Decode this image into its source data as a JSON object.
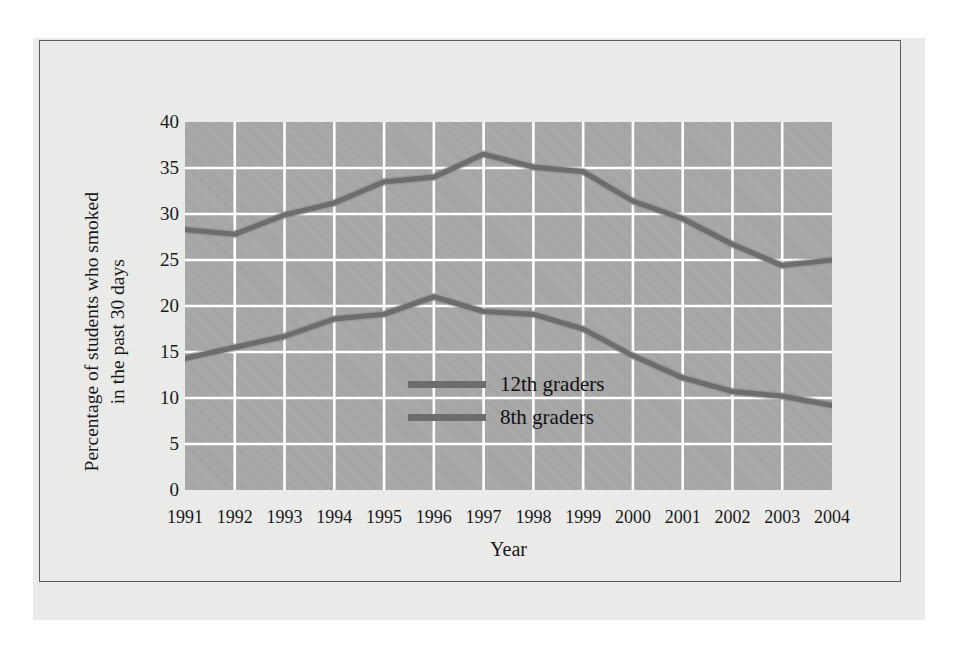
{
  "figure": {
    "paper_color": "#ededec",
    "plot_background_color": "#a8a8a8",
    "grid_color": "#ffffff",
    "frame_color": "#5d5d5d",
    "text_color": "#19191b"
  },
  "chart_data": {
    "type": "line",
    "title": "",
    "xlabel": "Year",
    "ylabel": "Percentage of students who smoked in the past 30 days",
    "ylabel_lines": [
      "Percentage of students who smoked",
      "in the past 30 days"
    ],
    "categories": [
      1991,
      1992,
      1993,
      1994,
      1995,
      1996,
      1997,
      1998,
      1999,
      2000,
      2001,
      2002,
      2003,
      2004
    ],
    "x_tick_labels": [
      "1991",
      "1992",
      "1993",
      "1994",
      "1995",
      "1996",
      "1997",
      "1998",
      "1999",
      "2000",
      "2001",
      "2002",
      "2003",
      "2004"
    ],
    "y_tick_labels": [
      "40",
      "35",
      "30",
      "25",
      "20",
      "15",
      "10",
      "5",
      "0"
    ],
    "y_ticks": [
      40,
      35,
      30,
      25,
      20,
      15,
      10,
      5,
      0
    ],
    "ylim": [
      0,
      40
    ],
    "xlim": [
      1991,
      2004
    ],
    "grid": true,
    "legend_position": "center",
    "series": [
      {
        "name": "12th graders",
        "color": "#6d6d6d",
        "values": [
          28.3,
          27.8,
          29.9,
          31.2,
          33.5,
          34.0,
          36.5,
          35.1,
          34.6,
          31.4,
          29.5,
          26.7,
          24.4,
          25.0
        ]
      },
      {
        "name": "8th graders",
        "color": "#6d6d6d",
        "values": [
          14.3,
          15.5,
          16.7,
          18.6,
          19.1,
          21.0,
          19.4,
          19.1,
          17.5,
          14.6,
          12.2,
          10.7,
          10.2,
          9.2
        ]
      }
    ]
  },
  "legend": {
    "items": [
      {
        "label": "12th graders"
      },
      {
        "label": "8th graders"
      }
    ]
  }
}
